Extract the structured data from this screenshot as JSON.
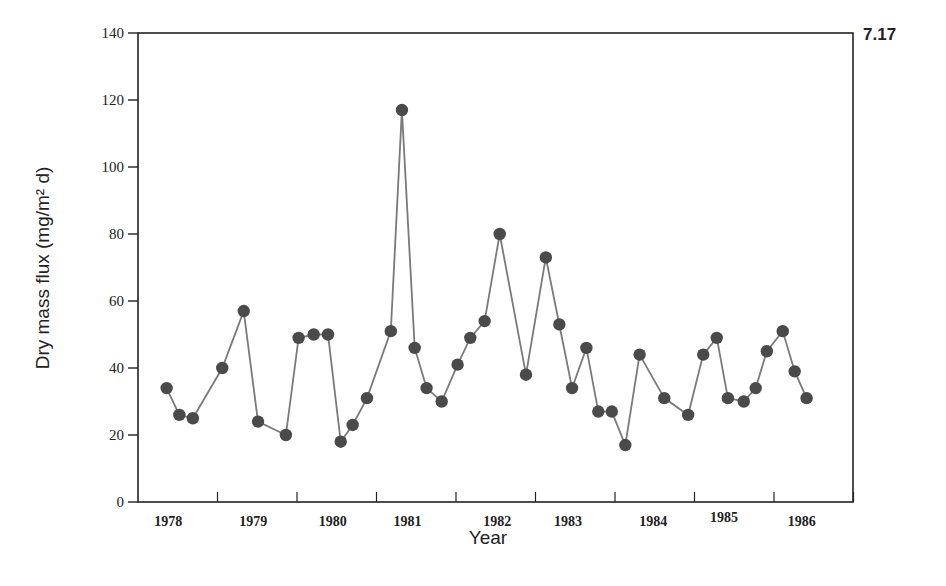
{
  "figure": {
    "number": "7.17"
  },
  "colors": {
    "axis": "#222222",
    "line": "#7a7a7a",
    "marker": "#4a4a4a",
    "background": "#ffffff"
  },
  "chart_data": {
    "type": "line",
    "title": "",
    "figure_label": "7.17",
    "xlabel": "Year",
    "ylabel": "Dry mass flux (mg/m² d)",
    "ylim": [
      0,
      140
    ],
    "yticks": [
      0,
      20,
      40,
      60,
      80,
      100,
      120,
      140
    ],
    "xlim": [
      1978.0,
      1987.0
    ],
    "xtick_positions": [
      1979,
      1980,
      1981,
      1982,
      1983,
      1984,
      1985,
      1986,
      1987
    ],
    "year_labels": [
      {
        "label": "1978",
        "x": 1978.38
      },
      {
        "label": "1979",
        "x": 1979.45
      },
      {
        "label": "1980",
        "x": 1980.45
      },
      {
        "label": "1981",
        "x": 1981.39
      },
      {
        "label": "1982",
        "x": 1982.52
      },
      {
        "label": "1983",
        "x": 1983.41
      },
      {
        "label": "1984",
        "x": 1984.48
      },
      {
        "label": "1985",
        "x": 1985.37
      },
      {
        "label": "1986",
        "x": 1986.35
      }
    ],
    "grid": false,
    "legend": null,
    "series": [
      {
        "name": "Dry mass flux",
        "marker": "filled-circle",
        "points": [
          {
            "x": 1978.36,
            "y": 34
          },
          {
            "x": 1978.52,
            "y": 26
          },
          {
            "x": 1978.69,
            "y": 25
          },
          {
            "x": 1979.06,
            "y": 40
          },
          {
            "x": 1979.33,
            "y": 57
          },
          {
            "x": 1979.51,
            "y": 24
          },
          {
            "x": 1979.86,
            "y": 20
          },
          {
            "x": 1980.02,
            "y": 49
          },
          {
            "x": 1980.21,
            "y": 50
          },
          {
            "x": 1980.39,
            "y": 50
          },
          {
            "x": 1980.55,
            "y": 18
          },
          {
            "x": 1980.7,
            "y": 23
          },
          {
            "x": 1980.88,
            "y": 31
          },
          {
            "x": 1981.18,
            "y": 51
          },
          {
            "x": 1981.32,
            "y": 117
          },
          {
            "x": 1981.48,
            "y": 46
          },
          {
            "x": 1981.63,
            "y": 34
          },
          {
            "x": 1981.82,
            "y": 30
          },
          {
            "x": 1982.02,
            "y": 41
          },
          {
            "x": 1982.18,
            "y": 49
          },
          {
            "x": 1982.36,
            "y": 54
          },
          {
            "x": 1982.55,
            "y": 80
          },
          {
            "x": 1982.88,
            "y": 38
          },
          {
            "x": 1983.13,
            "y": 73
          },
          {
            "x": 1983.3,
            "y": 53
          },
          {
            "x": 1983.46,
            "y": 34
          },
          {
            "x": 1983.64,
            "y": 46
          },
          {
            "x": 1983.79,
            "y": 27
          },
          {
            "x": 1983.96,
            "y": 27
          },
          {
            "x": 1984.13,
            "y": 17
          },
          {
            "x": 1984.31,
            "y": 44
          },
          {
            "x": 1984.62,
            "y": 31
          },
          {
            "x": 1984.92,
            "y": 26
          },
          {
            "x": 1985.11,
            "y": 44
          },
          {
            "x": 1985.28,
            "y": 49
          },
          {
            "x": 1985.42,
            "y": 31
          },
          {
            "x": 1985.62,
            "y": 30
          },
          {
            "x": 1985.77,
            "y": 34
          },
          {
            "x": 1985.91,
            "y": 45
          },
          {
            "x": 1986.11,
            "y": 51
          },
          {
            "x": 1986.26,
            "y": 39
          },
          {
            "x": 1986.41,
            "y": 31
          }
        ]
      }
    ]
  }
}
